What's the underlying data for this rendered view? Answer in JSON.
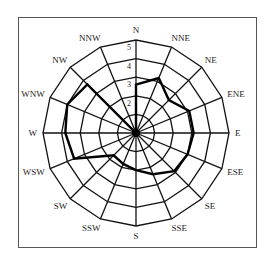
{
  "chart_data": {
    "type": "radar",
    "title": "",
    "categories": [
      "N",
      "NNE",
      "NE",
      "ENE",
      "E",
      "ESE",
      "SE",
      "SSE",
      "S",
      "SSW",
      "SW",
      "WSW",
      "W",
      "WNW",
      "NW",
      "NNW"
    ],
    "series": [
      {
        "name": "wind frequency",
        "values": [
          2.6,
          3.2,
          2.5,
          3.1,
          3.1,
          3.0,
          2.9,
          2.4,
          2.0,
          1.8,
          1.7,
          3.6,
          3.8,
          4.0,
          3.7,
          0.0
        ]
      }
    ],
    "radial_ticks": [
      1,
      2,
      3,
      4,
      5
    ],
    "radial_tick_labels_shown": [
      "2",
      "3",
      "4",
      "5"
    ],
    "rlim": [
      0,
      5
    ],
    "grid": true,
    "legend": "none"
  },
  "style": {
    "grid_color": "#111111",
    "series_color": "#000000",
    "frame_color": "#555555"
  }
}
